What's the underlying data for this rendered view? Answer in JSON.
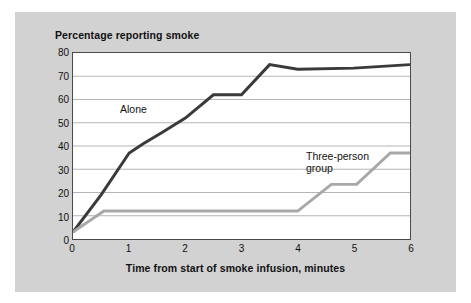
{
  "figure": {
    "background_color": "#d2d2d2",
    "plot_background_color": "#ffffff",
    "frame_color": "#4a4a4a",
    "gridline_color": "#b4b4b4"
  },
  "chart_data": {
    "type": "line",
    "title": "Percentage reporting smoke",
    "xlabel": "Time from start of smoke infusion, minutes",
    "ylabel": "",
    "xlim": [
      0,
      6
    ],
    "ylim": [
      0,
      80
    ],
    "grid": true,
    "grid_axis": "y",
    "legend": "inline-annotations",
    "xticks": [
      "0",
      "1",
      "2",
      "3",
      "4",
      "5",
      "6"
    ],
    "xtick_values": [
      0,
      1,
      2,
      3,
      4,
      5,
      6
    ],
    "yticks": [
      "0",
      "10",
      "20",
      "30",
      "40",
      "50",
      "60",
      "70",
      "80"
    ],
    "ytick_values": [
      0,
      10,
      20,
      30,
      40,
      50,
      60,
      70,
      80
    ],
    "series": [
      {
        "name": "Alone",
        "label": "Alone",
        "color": "#3a3a3a",
        "line_width": 3,
        "x": [
          0,
          0.5,
          1.0,
          1.25,
          1.6,
          2.0,
          2.5,
          3.0,
          3.5,
          4.0,
          5.0,
          6.0
        ],
        "values": [
          3,
          19,
          37,
          41,
          46,
          52,
          62,
          62,
          75,
          73,
          73.5,
          75
        ]
      },
      {
        "name": "Three-person group",
        "label_line1": "Three-person",
        "label_line2": "group",
        "color": "#a8a8a8",
        "line_width": 3,
        "x": [
          0,
          0.55,
          4.0,
          4.6,
          5.05,
          5.65,
          6.0
        ],
        "values": [
          3,
          12,
          12,
          23.5,
          23.5,
          37,
          37
        ]
      }
    ]
  }
}
